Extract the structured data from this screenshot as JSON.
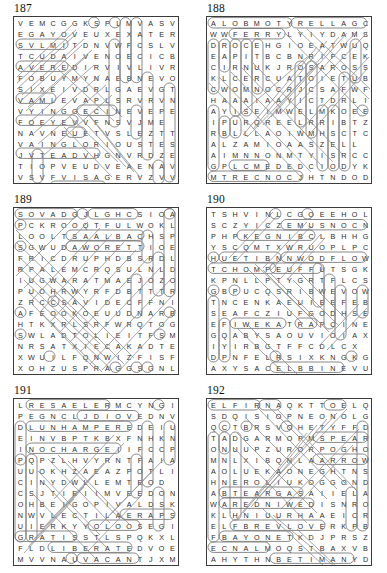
{
  "page": {
    "type": "word-search-puzzle-sheet",
    "columns": 2,
    "rows": 3,
    "grid_size": "15x15",
    "ink_color": "#2b2b2b",
    "mark_color": "#8d8d8d",
    "border_color": "#3b3b3b"
  },
  "puzzles": [
    {
      "number": "187",
      "position": {
        "col": 0,
        "row": 0
      },
      "rows": [
        "VEMCGGKSPLMVASV",
        "EGAYOVEUXEXATER",
        "SVLMITDNVWFCSLV",
        "TCUDAIVENOECICB",
        "AVEREDIRVIVLIVRN",
        "FOBUYMYNAEBNEVO",
        "SIXEIVDRLGAEVGT",
        "VAMLEVAPLSRVRVN",
        "VYINGGECINEVEPE",
        "FOEYEVVFNSVJME",
        "NAVNEUETVSLEZTT",
        "VAINGLORIOUSTES",
        "JVTEADVHGNVRDZE",
        "TIOPVEUDVEAENAV",
        "VSVFVISAGERVZVV"
      ]
    },
    {
      "number": "188",
      "position": {
        "col": 1,
        "row": 0
      },
      "rows": [
        "ALOBMOTYRELLAGC",
        "WWFERRYLYIYDAMS",
        "DROCEHGIOEATWUQ",
        "EAPITBCBNRIFCEK",
        "CIRNUKJROSAROSS",
        "KLCERCUATOIETUB",
        "CWOMNOCRJCSAFWF",
        "HAAAIAAYICTDRLI",
        "AYISEIMWELMKOEE",
        "IPURQREELRRIBTZ",
        "RBLLLAOIWMHSCTC",
        "ALZAMIOAASZELL",
        "AIMNNONMTYISRCC",
        "GPLCMEDEDCIODYK",
        "MTRECNOCJHTNDOD"
      ]
    },
    {
      "number": "189",
      "position": {
        "col": 0,
        "row": 1
      },
      "rows": [
        "SOVADGJLGHCSIOA",
        "PCKROOQTFULWOKL",
        "LOOLTSAALBACHSP",
        "SGWUDAWORETTIOE",
        "FRICDRUPHDBSRDLN",
        "RPALEMCRQSULNLD",
        "IUGWARATMAEJOZO",
        "PUOHRWYRFDBTTTR",
        "ZRCCSAVIDECFFNI",
        "AFEOOKOEUUDNARB",
        "HTKXRLSRFWRQTOG",
        "SWLADTOLIEITFSMO",
        "NRSATXIECAKADTE",
        "XWUILFQNWIZFISF",
        "XOHZUSPRAGGSGNL"
      ]
    },
    {
      "number": "190",
      "position": {
        "col": 1,
        "row": 1
      },
      "rows": [
        "TSHVINLCGOEEHOL",
        "SCZYICZEMUSNOCN",
        "PHPKEGNIBCLBHHG",
        "YSCQMTXWRUOPLPC",
        "HUETIBNNWODFLOW",
        "TCHOMPEUFFUTSGK",
        "KPNLLPTYGRTFLCS",
        "GBPUCQSRIBWEVOW",
        "TNCENKAEUIEEFEB",
        "SEAFCZIUFGODHSE",
        "EFIWEKATRAPCINE",
        "GQABYSAOUVIOIAX",
        "IYIRBGTFFCDLCX",
        "DPNFELRSIXKNGKG",
        "AXYSACELBBINEVU"
      ]
    },
    {
      "number": "191",
      "position": {
        "col": 0,
        "row": 2
      },
      "rows": [
        "LRESAELERMCYNGI",
        "PEGNCLJDIOVEDNV",
        "DLUNHAMPEREDEIU",
        "EINVBPTKBXFNHKN",
        "INOCHARGEIIFCCP",
        "PQPZLHVYRNTFAIA",
        "UUOKHZAEAZPOTLI",
        "CINYDWLLEMTEOD",
        "CSJTIEIIMVEEDON",
        "OHBEIGOPIVALDSK",
        "NWVLECTILAERAPS",
        "UIERKYYOLOOSEGI",
        "GRATISSTLSPQKXL",
        "FLDLIBERATEDVOE",
        "MVVNAUVACANTJXM"
      ]
    },
    {
      "number": "192",
      "position": {
        "col": 1,
        "row": 2
      },
      "rows": [
        "ELFIRNAQKTTOELQ",
        "SDQISIOPNEONOLG",
        "QCTBRSVOHETYFFD",
        "TADGARMOPMSPEAR",
        "ONUUPZURORPOGHO",
        "MNLXIBQNLAARROW",
        "AOLUEKAONEGHTNS",
        "HNEROLIUKOGGOND",
        "ABTEARGASAIIELA",
        "WAREDNIWEDISNRO",
        "KLHNIUURHAAEICR",
        "ELFBREVLOVERKPB",
        "FBAYONETKDJPRSZ",
        "ECNALMOQSTBAXVB",
        "AHYTHNBETIMANYD"
      ]
    }
  ]
}
